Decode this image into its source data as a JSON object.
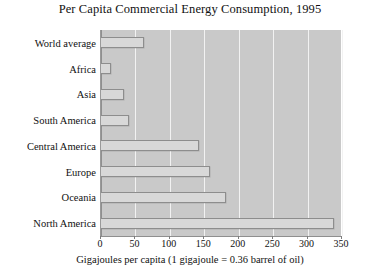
{
  "chart_data": {
    "type": "bar",
    "orientation": "horizontal",
    "title": "Per Capita Commercial Energy Consumption, 1995",
    "xlabel": "Gigajoules per capita (1 gigajoule = 0.36 barrel of oil)",
    "ylabel": "",
    "categories": [
      "World average",
      "Africa",
      "Asia",
      "South America",
      "Central America",
      "Europe",
      "Oceania",
      "North America"
    ],
    "values": [
      63,
      14,
      34,
      41,
      143,
      159,
      181,
      339
    ],
    "xlim": [
      0,
      350
    ],
    "xticks": [
      0,
      50,
      100,
      150,
      200,
      250,
      300,
      350
    ],
    "xticklabels": [
      "0",
      "50",
      "100",
      "150",
      "200",
      "250",
      "300",
      "350"
    ],
    "grid": true,
    "grid_axis": "x",
    "legend": false,
    "colors": {
      "plot_background": "#c9c9c9",
      "bar_fill": "#d8d8d8",
      "bar_edge": "#8d8d8d",
      "gridline": "#f2f2f2",
      "axis": "#8f8f8f",
      "text": "#111111",
      "figure_background": "#ffffff"
    }
  }
}
